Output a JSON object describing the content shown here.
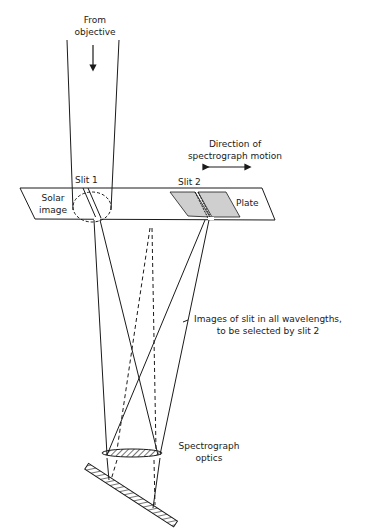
{
  "diagram": {
    "labels": {
      "from_objective_1": "From",
      "from_objective_2": "objective",
      "direction_1": "Direction of",
      "direction_2": "spectrograph motion",
      "slit1": "Slit 1",
      "slit2": "Slit 2",
      "solar_1": "Solar",
      "solar_2": "image",
      "plate": "Plate",
      "images_1": "Images of slit in all wavelengths,",
      "images_2": "to be selected by slit 2",
      "optics_1": "Spectrograph",
      "optics_2": "optics"
    },
    "colors": {
      "ink": "#1a1a1a",
      "plate_fill": "#cfcfcf",
      "background": "#ffffff"
    }
  }
}
